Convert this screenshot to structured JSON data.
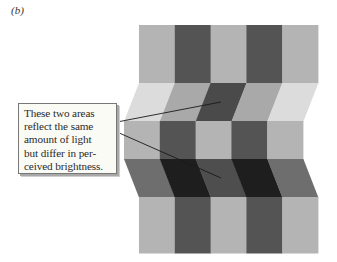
{
  "panel_label": "(b)",
  "callout": {
    "text": "These two areas\nreflect the same\namount of light\nbut differ in per-\nceived brightness."
  },
  "figure": {
    "colors": {
      "light": "#b4b4b4",
      "dark": "#545454",
      "very_light": "#dcdcdc",
      "medium": "#a9a9a9",
      "medium_dark": "#6e6e6e",
      "very_dark": "#1e1e1e",
      "target_upper": "#4a4a4a",
      "target_lower": "#4e4e4e"
    },
    "bands": [
      {
        "name": "top-flat-band",
        "y_top": 25,
        "y_bottom": 83,
        "left_top": 139,
        "left_bottom": 139,
        "col_width": 35.8,
        "cells": [
          "light",
          "dark",
          "light",
          "dark",
          "light"
        ]
      },
      {
        "name": "upper-slanted-band",
        "y_top": 83,
        "y_bottom": 121,
        "left_top": 139,
        "left_bottom": 124,
        "col_width": 35.8,
        "cells": [
          "very_light",
          "medium",
          "target_upper",
          "medium",
          "very_light"
        ]
      },
      {
        "name": "middle-flat-band",
        "y_top": 121,
        "y_bottom": 159,
        "left_top": 124,
        "left_bottom": 124,
        "col_width": 35.8,
        "cells": [
          "light",
          "dark",
          "light",
          "dark",
          "light"
        ]
      },
      {
        "name": "lower-slanted-band",
        "y_top": 159,
        "y_bottom": 197,
        "left_top": 124,
        "left_bottom": 139,
        "col_width": 35.8,
        "cells": [
          "medium_dark",
          "very_dark",
          "target_lower",
          "very_dark",
          "medium_dark"
        ]
      },
      {
        "name": "bottom-flat-band",
        "y_top": 197,
        "y_bottom": 253,
        "left_top": 139,
        "left_bottom": 139,
        "col_width": 35.8,
        "cells": [
          "light",
          "dark",
          "light",
          "dark",
          "light"
        ]
      }
    ],
    "leader_lines": [
      {
        "name": "leader-line-upper",
        "x1": 117,
        "y1": 122,
        "x2": 221,
        "y2": 102
      },
      {
        "name": "leader-line-lower",
        "x1": 117,
        "y1": 132,
        "x2": 221,
        "y2": 178
      }
    ],
    "line_color": "#1a1a1a"
  }
}
